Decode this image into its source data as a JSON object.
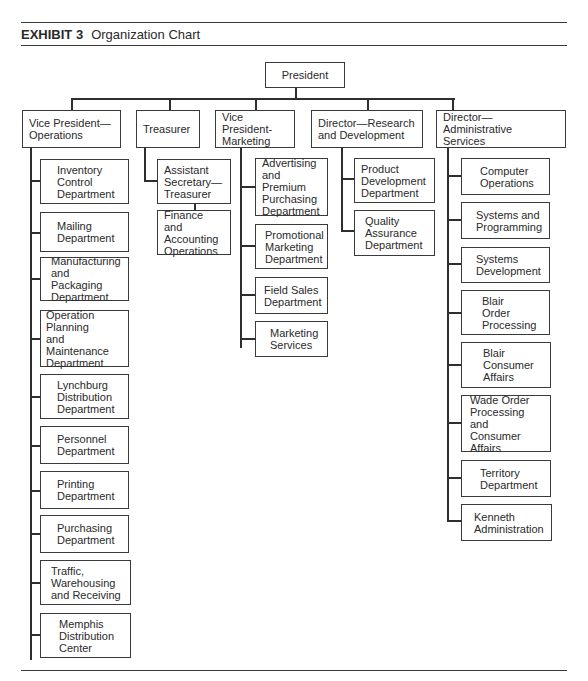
{
  "header": {
    "exhibit": "EXHIBIT 3",
    "title": "Organization Chart"
  },
  "chart": {
    "root": {
      "label": "President"
    },
    "divisions": [
      {
        "label": "Vice President—\nOperations",
        "children": [
          "Inventory\nControl\nDepartment",
          "Mailing\nDepartment",
          "Manufacturing\nand Packaging\nDepartment",
          "Operation\nPlanning\nand Maintenance\nDepartment",
          "Lynchburg\nDistribution\nDepartment",
          "Personnel\nDepartment",
          "Printing\nDepartment",
          "Purchasing\nDepartment",
          "Traffic,\nWarehousing\nand Receiving",
          "Memphis\nDistribution\nCenter"
        ]
      },
      {
        "label": "Treasurer",
        "children": [
          "Assistant\nSecretary—\nTreasurer",
          "Finance and\nAccounting\nOperations"
        ]
      },
      {
        "label": "Vice President-\nMarketing",
        "children": [
          "Advertising\nand Premium\nPurchasing\nDepartment",
          "Promotional\nMarketing\nDepartment",
          "Field Sales\nDepartment",
          "Marketing\nServices"
        ]
      },
      {
        "label": "Director—Research\nand Development",
        "children": [
          "Product\nDevelopment\nDepartment",
          "Quality\nAssurance\nDepartment"
        ]
      },
      {
        "label": "Director—Administrative\nServices",
        "children": [
          "Computer\nOperations",
          "Systems and\nProgramming",
          "Systems\nDevelopment",
          "Blair\nOrder\nProcessing",
          "Blair\nConsumer\nAffairs",
          "Wade Order\nProcessing and\nConsumer\nAffairs",
          "Territory\nDepartment",
          "Kenneth\nAdministration"
        ]
      }
    ]
  }
}
